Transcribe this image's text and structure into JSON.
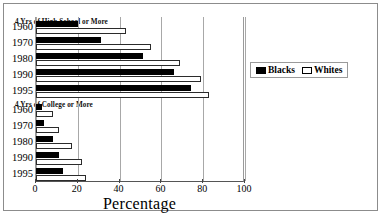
{
  "chart_data": {
    "type": "bar",
    "orientation": "horizontal",
    "title": "",
    "xlabel": "Percentage",
    "ylabel": "",
    "xlim": [
      0,
      100
    ],
    "xticks": [
      0,
      20,
      40,
      60,
      80,
      100
    ],
    "grid": true,
    "legend_position": "right",
    "legend": [
      "Blacks",
      "Whites"
    ],
    "panels": [
      {
        "caption": "4 Yrs of High School or More",
        "categories": [
          "1960",
          "1970",
          "1980",
          "1990",
          "1995"
        ],
        "series": [
          {
            "name": "Blacks",
            "values": [
              20,
              31,
              51,
              66,
              74
            ]
          },
          {
            "name": "Whites",
            "values": [
              43,
              55,
              69,
              79,
              83
            ]
          }
        ]
      },
      {
        "caption": "4 Yrs of College or More",
        "categories": [
          "1960",
          "1970",
          "1980",
          "1990",
          "1995"
        ],
        "series": [
          {
            "name": "Blacks",
            "values": [
              3,
              4,
              8,
              11,
              13
            ]
          },
          {
            "name": "Whites",
            "values": [
              8,
              11,
              17,
              22,
              24
            ]
          }
        ]
      }
    ],
    "colors": {
      "blacks": "#000000",
      "whites": "#ffffff",
      "outline": "#000000",
      "grid": "#a8a8a8",
      "frame": "#8c8c8c"
    }
  },
  "axis": {
    "tick_labels": [
      "0",
      "20",
      "40",
      "60",
      "80",
      "100"
    ],
    "title": "Percentage"
  },
  "legend": {
    "items": [
      {
        "label": "Blacks",
        "swatch": "filled-square"
      },
      {
        "label": "Whites",
        "swatch": "hollow-square"
      }
    ]
  }
}
